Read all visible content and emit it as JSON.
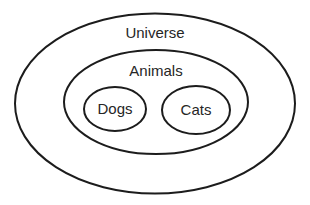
{
  "diagram": {
    "type": "venn-nested-sets",
    "stroke_color": "#1c1c1c",
    "text_color": "#262626",
    "background": "#ffffff",
    "sets": [
      {
        "id": "universe",
        "label": "Universe",
        "ellipse": {
          "cx": 155,
          "cy": 103.5,
          "rx": 140,
          "ry": 90
        },
        "label_pos": {
          "x": 155,
          "y": 32
        },
        "contains": [
          "animals"
        ]
      },
      {
        "id": "animals",
        "label": "Animals",
        "ellipse": {
          "cx": 156,
          "cy": 102,
          "rx": 92,
          "ry": 52
        },
        "label_pos": {
          "x": 156,
          "y": 70
        },
        "contains": [
          "dogs",
          "cats"
        ]
      },
      {
        "id": "dogs",
        "label": "Dogs",
        "ellipse": {
          "cx": 115,
          "cy": 109,
          "rx": 31,
          "ry": 22
        },
        "label_pos": {
          "x": 115,
          "y": 108
        },
        "contains": []
      },
      {
        "id": "cats",
        "label": "Cats",
        "ellipse": {
          "cx": 196,
          "cy": 110,
          "rx": 34,
          "ry": 24
        },
        "label_pos": {
          "x": 196,
          "y": 109
        },
        "contains": []
      }
    ]
  }
}
